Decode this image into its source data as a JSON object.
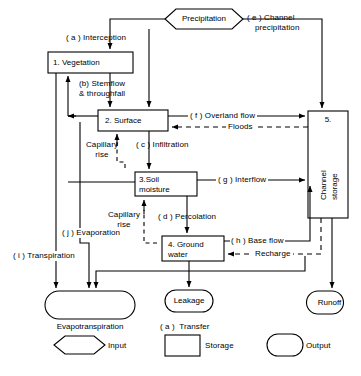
{
  "diagram": {
    "stroke_color": "#000000",
    "background": "#ffffff"
  },
  "inputs": [
    {
      "id": "precipitation",
      "label": "Precipitation",
      "shape": "hexagon"
    }
  ],
  "storages": [
    {
      "id": "vegetation",
      "number": "1.",
      "label": "1. Vegetation",
      "shape": "rect"
    },
    {
      "id": "surface",
      "number": "2.",
      "label": "2. Surface",
      "shape": "rect"
    },
    {
      "id": "soil-moisture",
      "number": "3.",
      "label": "3.Soil\nmoisture",
      "line1": "3.Soil",
      "line2": "moisture",
      "shape": "rect"
    },
    {
      "id": "ground-water",
      "number": "4.",
      "label": "4. Ground\nwater",
      "line1": "4. Ground",
      "line2": "water",
      "shape": "rect"
    },
    {
      "id": "channel-storage",
      "number": "5.",
      "label": "Channel\nstorage",
      "line1": "Channel",
      "line2": "storage",
      "shape": "rect"
    }
  ],
  "outputs": [
    {
      "id": "evapotranspiration",
      "label": "Evapotranspiration",
      "shape": "stadium"
    },
    {
      "id": "leakage",
      "label": "Leakage",
      "shape": "stadium"
    },
    {
      "id": "runoff",
      "label": "Runoff",
      "shape": "stadium"
    }
  ],
  "transfers": [
    {
      "key": "( a )",
      "label": "( a ) Interception",
      "text": "Interception",
      "from": "precipitation",
      "to": "vegetation"
    },
    {
      "key": "(b)",
      "label": "(b) Stemflow\n& throughfall",
      "line1": "(b) Stemflow",
      "line2": "& throughfall",
      "from": "vegetation",
      "to": "surface"
    },
    {
      "key": "( c )",
      "label": "( c ) Infiltration",
      "text": "Infiltration",
      "from": "surface",
      "to": "soil-moisture"
    },
    {
      "key": "( d )",
      "label": "( d ) Percolation",
      "text": "Percolation",
      "from": "soil-moisture",
      "to": "ground-water"
    },
    {
      "key": "( e )",
      "label": "( e ) Channel\nprecipitation",
      "line1": "( e ) Channel",
      "line2": "precipitation",
      "from": "precipitation",
      "to": "channel-storage"
    },
    {
      "key": "( f )",
      "label": "( f ) Overland flow",
      "text": "Overland flow",
      "from": "surface",
      "to": "channel-storage"
    },
    {
      "key": "( g )",
      "label": "( g ) Interflow",
      "text": "Interflow",
      "from": "soil-moisture",
      "to": "channel-storage"
    },
    {
      "key": "( h )",
      "label": "( h ) Base flow",
      "text": "Base flow",
      "from": "ground-water",
      "to": "channel-storage"
    },
    {
      "key": "( i )",
      "label": "( i ) Transpiration",
      "text": "Transpiration",
      "from": "vegetation",
      "to": "evapotranspiration"
    },
    {
      "key": "( j )",
      "label": "( j ) Evaporation",
      "text": "Evaporation",
      "from": "surface",
      "to": "evapotranspiration"
    }
  ],
  "feedback_flows": [
    {
      "id": "floods",
      "label": "Floods",
      "style": "dashed"
    },
    {
      "id": "recharge",
      "label": "Recharge",
      "style": "dashed"
    },
    {
      "id": "capillary-rise-1",
      "line1": "Capillary",
      "line2": "rise",
      "label": "Capillary rise",
      "style": "dashed"
    },
    {
      "id": "capillary-rise-2",
      "line1": "Capillary",
      "line2": "rise",
      "label": "Capillary rise",
      "style": "dashed"
    }
  ],
  "caption": {
    "transfer_note": "( a )  Transfer"
  },
  "legend": {
    "items": [
      {
        "id": "input",
        "label": "Input",
        "shape": "hexagon"
      },
      {
        "id": "storage",
        "label": "Storage",
        "shape": "rect"
      },
      {
        "id": "output",
        "label": "Output",
        "shape": "stadium"
      }
    ]
  }
}
